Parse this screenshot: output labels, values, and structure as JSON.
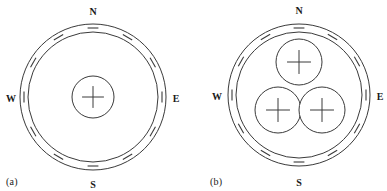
{
  "figure": {
    "background_color": "#ffffff",
    "line_color": "#3a3a3a",
    "text_color": "#1a1a1a"
  },
  "panels": [
    {
      "caption": "(a)",
      "center": {
        "x": 93,
        "y": 97
      },
      "outer_shield": {
        "outer_radius": 73,
        "inner_radius": 65,
        "charge_sign": "−",
        "charge_count": 12,
        "charge_label": "negative"
      },
      "conductors": [
        {
          "cx": 93,
          "cy": 97,
          "r": 21,
          "charge_sign": "+",
          "charge_label": "positive"
        }
      ],
      "direction_labels": [
        {
          "text": "N",
          "x": 93,
          "y": 13,
          "anchor": "middle"
        },
        {
          "text": "E",
          "x": 176,
          "y": 100,
          "anchor": "middle"
        },
        {
          "text": "S",
          "x": 93,
          "y": 186,
          "anchor": "middle"
        },
        {
          "text": "W",
          "x": 11,
          "y": 100,
          "anchor": "middle"
        }
      ]
    },
    {
      "caption": "(b)",
      "center": {
        "x": 106,
        "y": 95
      },
      "outer_shield": {
        "outer_radius": 71,
        "inner_radius": 63,
        "charge_sign": "−",
        "charge_count": 12,
        "charge_label": "negative"
      },
      "conductors": [
        {
          "cx": 106,
          "cy": 62,
          "r": 23,
          "charge_sign": "+",
          "charge_label": "positive"
        },
        {
          "cx": 85,
          "cy": 110,
          "r": 23,
          "charge_sign": "+",
          "charge_label": "positive"
        },
        {
          "cx": 129,
          "cy": 110,
          "r": 23,
          "charge_sign": "+",
          "charge_label": "positive"
        }
      ],
      "direction_labels": [
        {
          "text": "N",
          "x": 106,
          "y": 12,
          "anchor": "middle"
        },
        {
          "text": "E",
          "x": 187,
          "y": 98,
          "anchor": "middle"
        },
        {
          "text": "S",
          "x": 106,
          "y": 184,
          "anchor": "middle"
        },
        {
          "text": "W",
          "x": 24,
          "y": 98,
          "anchor": "middle"
        }
      ]
    }
  ]
}
